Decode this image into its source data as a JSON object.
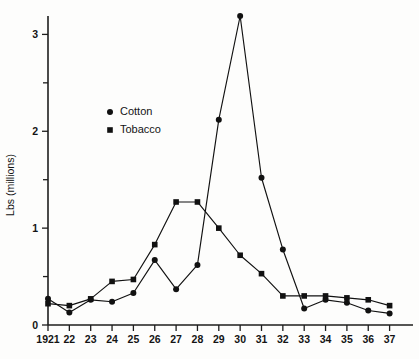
{
  "chart_data": {
    "type": "line",
    "title": "",
    "xlabel": "",
    "ylabel": "Lbs (millions)",
    "xlim": [
      1921,
      1937
    ],
    "ylim": [
      0,
      3.3
    ],
    "grid": false,
    "legend_position": "upper-left-inside",
    "x": [
      1921,
      1922,
      1923,
      1924,
      1925,
      1926,
      1927,
      1928,
      1929,
      1930,
      1931,
      1932,
      1933,
      1934,
      1935,
      1936,
      1937
    ],
    "x_tick_labels": [
      "1921",
      "22",
      "23",
      "24",
      "25",
      "26",
      "27",
      "28",
      "29",
      "30",
      "31",
      "32",
      "33",
      "34",
      "35",
      "36",
      "37"
    ],
    "y_tick_labels": [
      "0",
      "1",
      "2",
      "3"
    ],
    "y_ticks": [
      0,
      1,
      2,
      3
    ],
    "y_minor_ticks": [
      0.5,
      1.5,
      2.5
    ],
    "series": [
      {
        "name": "Cotton",
        "marker": "circle",
        "values": [
          0.27,
          0.13,
          0.26,
          0.24,
          0.33,
          0.67,
          0.37,
          0.62,
          2.12,
          3.19,
          1.52,
          0.78,
          0.17,
          0.26,
          0.23,
          0.15,
          0.12
        ]
      },
      {
        "name": "Tobacco",
        "marker": "square",
        "values": [
          0.22,
          0.2,
          0.27,
          0.45,
          0.47,
          0.83,
          1.27,
          1.27,
          1.0,
          0.72,
          0.53,
          0.3,
          0.3,
          0.3,
          0.28,
          0.26,
          0.2
        ]
      }
    ]
  },
  "legend": {
    "items": [
      {
        "label": "Cotton",
        "marker": "circle"
      },
      {
        "label": "Tobacco",
        "marker": "square"
      }
    ]
  },
  "axis": {
    "y_title": "Lbs (millions)"
  }
}
